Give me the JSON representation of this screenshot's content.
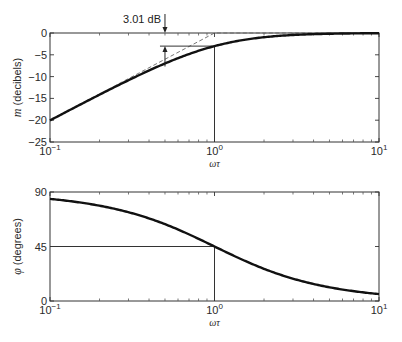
{
  "chart_data": [
    {
      "type": "line",
      "title": "",
      "xlabel": "ωτ",
      "ylabel": "m (decibels)",
      "ylabel_symbol": "m",
      "ylabel_unit": "(decibels)",
      "xscale": "log",
      "xlim": [
        0.1,
        10
      ],
      "ylim": [
        -25,
        0
      ],
      "grid": false,
      "x_ticks": [
        {
          "value": 0.1,
          "label": "10",
          "exp": "−1"
        },
        {
          "value": 1,
          "label": "10",
          "exp": "0"
        },
        {
          "value": 10,
          "label": "10",
          "exp": "1"
        }
      ],
      "y_ticks": [
        0,
        -5,
        -10,
        -15,
        -20,
        -25
      ],
      "y_tick_labels": [
        "0",
        "−5",
        "−10",
        "−15",
        "−20",
        "−25"
      ],
      "series": [
        {
          "name": "magnitude",
          "style": "solid-thick",
          "x": [
            0.1,
            0.15,
            0.2,
            0.3,
            0.5,
            0.7,
            1.0,
            1.5,
            2.0,
            3.0,
            5.0,
            7.0,
            10.0
          ],
          "y": [
            -20.04,
            -16.6,
            -14.15,
            -10.8,
            -6.99,
            -4.77,
            -3.01,
            -1.6,
            -0.97,
            -0.46,
            -0.17,
            -0.09,
            -0.04
          ]
        },
        {
          "name": "asymptote",
          "style": "dashed",
          "x": [
            0.1,
            1.0,
            10.0
          ],
          "y": [
            -20,
            0,
            0
          ]
        }
      ],
      "annotations": [
        {
          "text": "3.01 dB",
          "type": "double-arrow",
          "x": 0.5,
          "y_from": -6.99,
          "y_to": -3.01,
          "note": "difference between asymptote and curve"
        },
        {
          "type": "vline",
          "x": 1.0,
          "y_from": -25,
          "y_to": -3.01
        },
        {
          "type": "hline",
          "y": -3.01,
          "x_from": 0.5,
          "x_to": 1.0
        }
      ]
    },
    {
      "type": "line",
      "title": "",
      "xlabel": "ωτ",
      "ylabel": "φ (degrees)",
      "ylabel_symbol": "φ",
      "ylabel_unit": "(degrees)",
      "xscale": "log",
      "xlim": [
        0.1,
        10
      ],
      "ylim": [
        0,
        90
      ],
      "grid": false,
      "x_ticks": [
        {
          "value": 0.1,
          "label": "10",
          "exp": "−1"
        },
        {
          "value": 1,
          "label": "10",
          "exp": "0"
        },
        {
          "value": 10,
          "label": "10",
          "exp": "1"
        }
      ],
      "y_ticks": [
        0,
        45,
        90
      ],
      "y_tick_labels": [
        "0",
        "45",
        "90"
      ],
      "series": [
        {
          "name": "phase",
          "style": "solid-thick",
          "x": [
            0.1,
            0.15,
            0.2,
            0.3,
            0.5,
            0.7,
            1.0,
            1.5,
            2.0,
            3.0,
            5.0,
            7.0,
            10.0
          ],
          "y": [
            84.3,
            81.5,
            78.7,
            73.3,
            63.4,
            55.0,
            45.0,
            33.7,
            26.6,
            18.4,
            11.3,
            8.1,
            5.7
          ]
        }
      ],
      "annotations": [
        {
          "type": "vline",
          "x": 1.0,
          "y_from": 0,
          "y_to": 45
        },
        {
          "type": "hline",
          "y": 45,
          "x_from": 0.1,
          "x_to": 1.0
        }
      ]
    }
  ],
  "colors": {
    "curve": "#111111",
    "axes": "#333333",
    "guide": "#333333",
    "dashed": "#666666"
  }
}
